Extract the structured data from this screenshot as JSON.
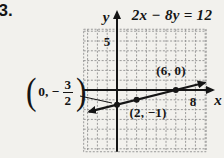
{
  "problem_number": "33.",
  "equation": "2x − 8y = 12",
  "axes": {
    "x_label": "x",
    "y_label": "y",
    "x_tick": "8",
    "y_tick": "5"
  },
  "point_labels": {
    "intercept_y": {
      "open": "(",
      "prefix": "0, −",
      "numerator": "3",
      "denominator": "2",
      "close": ")"
    },
    "point_2_neg1": "(2, −1)",
    "point_6_0": "(6, 0)"
  },
  "colors": {
    "ink": "#151515",
    "grid_line": "#8f8f8f",
    "paper": "#f2f1ed"
  },
  "chart_data": {
    "type": "line",
    "title": "2x − 8y = 12",
    "equation": "2x − 8y = 12",
    "slope": 0.25,
    "y_intercept": -1.5,
    "x_intercept": 6,
    "labeled_points": [
      {
        "x": 0,
        "y": -1.5,
        "label": "(0, −3/2)"
      },
      {
        "x": 2,
        "y": -1,
        "label": "(2, −1)"
      },
      {
        "x": 6,
        "y": 0,
        "label": "(6, 0)"
      }
    ],
    "x_tick_labels": [
      {
        "value": 8,
        "label": "8"
      }
    ],
    "y_tick_labels": [
      {
        "value": 5,
        "label": "5"
      }
    ],
    "xlim": [
      -3.4,
      9.1
    ],
    "ylim": [
      -6.3,
      6.2
    ],
    "grid": true,
    "line_x_range": [
      -2.85,
      8.95
    ]
  }
}
